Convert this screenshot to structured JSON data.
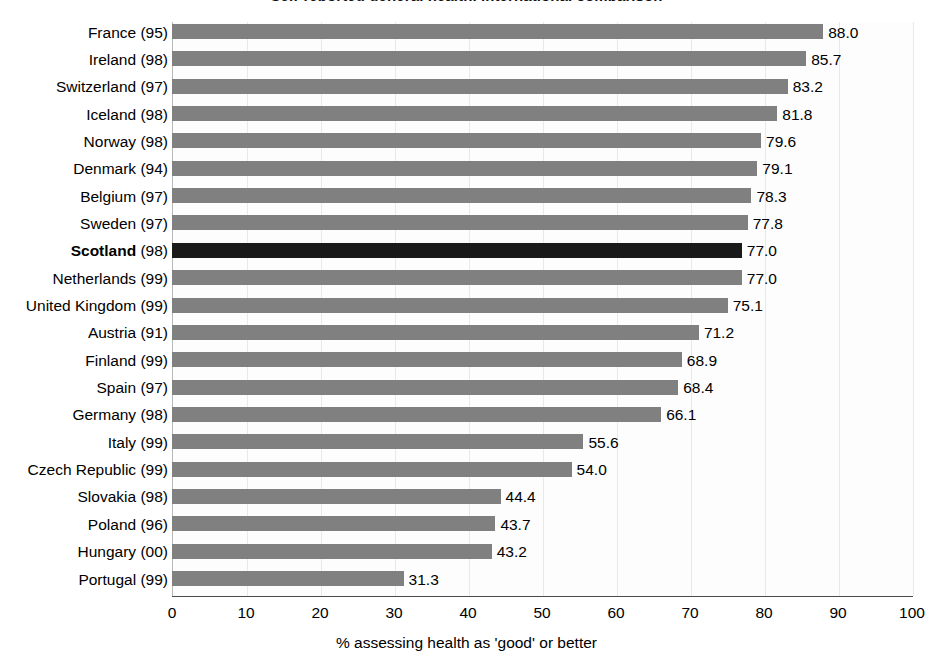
{
  "chart_data": {
    "type": "bar",
    "orientation": "horizontal",
    "title": "Self-reported general health, international comparison",
    "xlabel": "% assessing health as 'good' or better",
    "ylabel": "",
    "xlim": [
      0,
      100
    ],
    "xticks": [
      0,
      10,
      20,
      30,
      40,
      50,
      60,
      70,
      80,
      90,
      100
    ],
    "grid": true,
    "legend": "none",
    "highlight_category": "Scotland (98)",
    "categories": [
      "France (95)",
      "Ireland (98)",
      "Switzerland (97)",
      "Iceland (98)",
      "Norway (98)",
      "Denmark (94)",
      "Belgium (97)",
      "Sweden (97)",
      "Scotland (98)",
      "Netherlands (99)",
      "United Kingdom (99)",
      "Austria (91)",
      "Finland (99)",
      "Spain (97)",
      "Germany (98)",
      "Italy (99)",
      "Czech Republic (99)",
      "Slovakia (98)",
      "Poland (96)",
      "Hungary (00)",
      "Portugal (99)"
    ],
    "values": [
      88.0,
      85.7,
      83.2,
      81.8,
      79.6,
      79.1,
      78.3,
      77.8,
      77.0,
      77.0,
      75.1,
      71.2,
      68.9,
      68.4,
      66.1,
      55.6,
      54.0,
      44.4,
      43.7,
      43.2,
      31.3
    ],
    "value_labels": [
      "88.0",
      "85.7",
      "83.2",
      "81.8",
      "79.6",
      "79.1",
      "78.3",
      "77.8",
      "77.0",
      "77.0",
      "75.1",
      "71.2",
      "68.9",
      "68.4",
      "66.1",
      "55.6",
      "54.0",
      "44.4",
      "43.7",
      "43.2",
      "31.3"
    ],
    "bars": [
      {
        "name": "France",
        "year": "(95)",
        "value": 88.0,
        "label": "88.0",
        "highlight": false
      },
      {
        "name": "Ireland",
        "year": "(98)",
        "value": 85.7,
        "label": "85.7",
        "highlight": false
      },
      {
        "name": "Switzerland",
        "year": "(97)",
        "value": 83.2,
        "label": "83.2",
        "highlight": false
      },
      {
        "name": "Iceland",
        "year": "(98)",
        "value": 81.8,
        "label": "81.8",
        "highlight": false
      },
      {
        "name": "Norway",
        "year": "(98)",
        "value": 79.6,
        "label": "79.6",
        "highlight": false
      },
      {
        "name": "Denmark",
        "year": "(94)",
        "value": 79.1,
        "label": "79.1",
        "highlight": false
      },
      {
        "name": "Belgium",
        "year": "(97)",
        "value": 78.3,
        "label": "78.3",
        "highlight": false
      },
      {
        "name": "Sweden",
        "year": "(97)",
        "value": 77.8,
        "label": "77.8",
        "highlight": false
      },
      {
        "name": "Scotland",
        "year": "(98)",
        "value": 77.0,
        "label": "77.0",
        "highlight": true
      },
      {
        "name": "Netherlands",
        "year": "(99)",
        "value": 77.0,
        "label": "77.0",
        "highlight": false
      },
      {
        "name": "United Kingdom",
        "year": "(99)",
        "value": 75.1,
        "label": "75.1",
        "highlight": false
      },
      {
        "name": "Austria",
        "year": "(91)",
        "value": 71.2,
        "label": "71.2",
        "highlight": false
      },
      {
        "name": "Finland",
        "year": "(99)",
        "value": 68.9,
        "label": "68.9",
        "highlight": false
      },
      {
        "name": "Spain",
        "year": "(97)",
        "value": 68.4,
        "label": "68.4",
        "highlight": false
      },
      {
        "name": "Germany",
        "year": "(98)",
        "value": 66.1,
        "label": "66.1",
        "highlight": false
      },
      {
        "name": "Italy",
        "year": "(99)",
        "value": 55.6,
        "label": "55.6",
        "highlight": false
      },
      {
        "name": "Czech Republic",
        "year": "(99)",
        "value": 54.0,
        "label": "54.0",
        "highlight": false
      },
      {
        "name": "Slovakia",
        "year": "(98)",
        "value": 44.4,
        "label": "44.4",
        "highlight": false
      },
      {
        "name": "Poland",
        "year": "(96)",
        "value": 43.7,
        "label": "43.7",
        "highlight": false
      },
      {
        "name": "Hungary",
        "year": "(00)",
        "value": 43.2,
        "label": "43.2",
        "highlight": false
      },
      {
        "name": "Portugal",
        "year": "(99)",
        "value": 31.3,
        "label": "31.3",
        "highlight": false
      }
    ],
    "colors": {
      "bar": "#808080",
      "bar_highlight": "#1a1a1a",
      "gridline": "#e9e9e9",
      "axis": "#4a4a4a",
      "text": "#000000",
      "plot_background": "#fdfdfd"
    }
  }
}
